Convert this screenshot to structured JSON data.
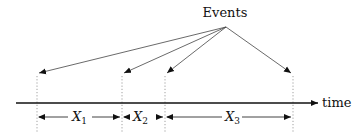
{
  "diagram": {
    "title_label": "Events",
    "axis_label": "time",
    "colors": {
      "line": "#111111",
      "pointer": "#444444",
      "dotted": "#888888",
      "background": "#ffffff"
    },
    "events": [
      {
        "id": "event-1",
        "x": 37
      },
      {
        "id": "event-2",
        "x": 122
      },
      {
        "id": "event-3",
        "x": 165
      },
      {
        "id": "event-4",
        "x": 293
      }
    ],
    "intervals": [
      {
        "name": "X",
        "subscript": "1",
        "from": "event-1",
        "to": "event-2"
      },
      {
        "name": "X",
        "subscript": "2",
        "from": "event-2",
        "to": "event-3"
      },
      {
        "name": "X",
        "subscript": "3",
        "from": "event-3",
        "to": "event-4"
      }
    ]
  }
}
